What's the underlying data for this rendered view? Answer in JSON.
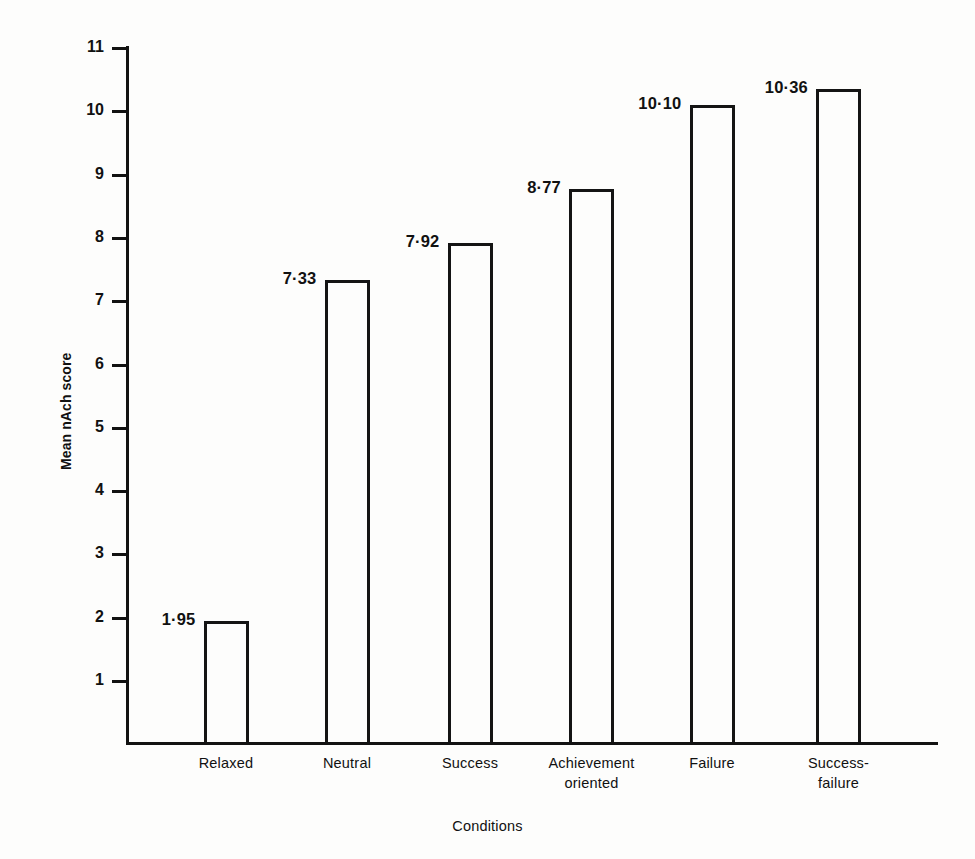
{
  "figure": {
    "width": 975,
    "height": 859,
    "background_color": "#fdfdfc",
    "ink_color": "#121212"
  },
  "chart_data": {
    "type": "bar",
    "title": "",
    "subtitle": "",
    "xlabel": "Conditions",
    "ylabel": "Mean nAch score",
    "categories": [
      "Relaxed",
      "Neutral",
      "Success",
      "Achievement oriented",
      "Failure",
      "Success-failure"
    ],
    "category_lines": [
      [
        "Relaxed"
      ],
      [
        "Neutral"
      ],
      [
        "Success"
      ],
      [
        "Achievement",
        "oriented"
      ],
      [
        "Failure"
      ],
      [
        "Success-",
        "failure"
      ]
    ],
    "values": [
      1.95,
      7.33,
      7.92,
      8.77,
      10.1,
      10.36
    ],
    "value_labels": [
      "1·95",
      "7·33",
      "7·92",
      "8·77",
      "10·10",
      "10·36"
    ],
    "ylim": [
      0,
      11
    ],
    "yticks": [
      1,
      2,
      3,
      4,
      5,
      6,
      7,
      8,
      9,
      10,
      11
    ],
    "ytick_labels": [
      "1",
      "2",
      "3",
      "4",
      "5",
      "6",
      "7",
      "8",
      "9",
      "10",
      "11"
    ],
    "xlim_note": "categorical",
    "grid": false,
    "legend": false,
    "legend_position": "none",
    "bar_style": "outline-only",
    "bar_fill": "none",
    "bar_edge_color": "#141414",
    "decimal_separator": "middle-dot"
  },
  "axes": {
    "y_axis_top_value": 11,
    "y_axis_bottom_value": 1,
    "baseline_label": "x-axis baseline"
  }
}
